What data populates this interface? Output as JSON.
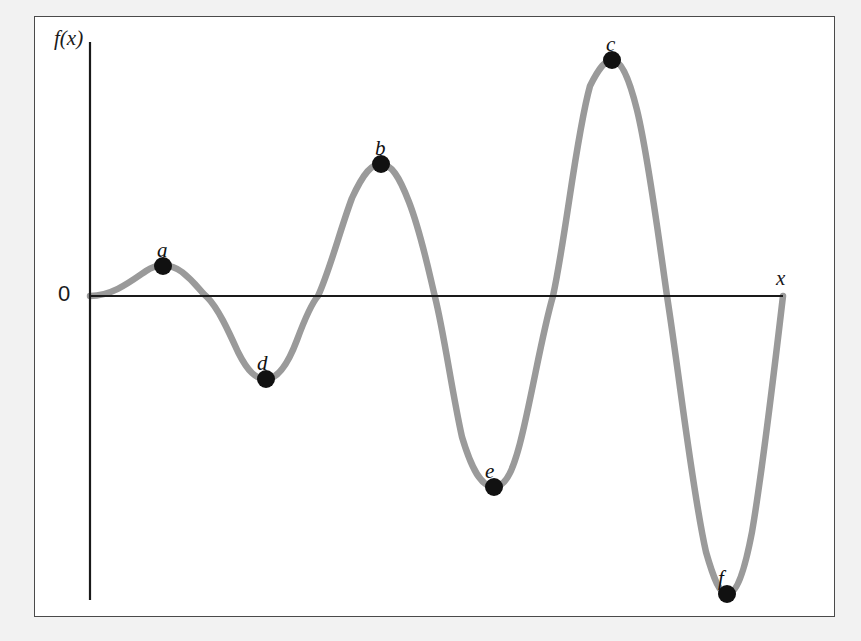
{
  "figure": {
    "background_color": "#f2f2f2",
    "panel_color": "#ffffff",
    "frame_color": "#4a4a4a",
    "curve_color": "#9a9a9a",
    "axis_color": "#1a1a1a",
    "marker_color": "#111111"
  },
  "axes": {
    "y_label": "f(x)",
    "x_label": "x",
    "origin_label": "0"
  },
  "chart_data": {
    "type": "line",
    "title": "",
    "xlabel": "x",
    "ylabel": "f(x)",
    "grid": false,
    "legend": "none",
    "xlim": [
      0,
      800
    ],
    "ylim": [
      -320,
      250
    ],
    "axis_pixels": {
      "x_axis_y": 296,
      "y_axis_x": 90,
      "x_axis_end": 783,
      "y_axis_top": 42,
      "y_axis_bottom": 600
    },
    "zero_crossings_px": [
      90,
      207,
      318,
      435,
      553,
      667,
      783
    ],
    "labeled_points": [
      {
        "label": "a",
        "kind": "local maximum",
        "x_px": 163,
        "y_px": 266,
        "label_x_px": 157,
        "label_y_px": 238
      },
      {
        "label": "b",
        "kind": "local maximum",
        "x_px": 381,
        "y_px": 164,
        "label_x_px": 375,
        "label_y_px": 136
      },
      {
        "label": "c",
        "kind": "global maximum",
        "x_px": 612,
        "y_px": 60,
        "label_x_px": 606,
        "label_y_px": 32
      },
      {
        "label": "d",
        "kind": "local minimum",
        "x_px": 266,
        "y_px": 379,
        "label_x_px": 257,
        "label_y_px": 351
      },
      {
        "label": "e",
        "kind": "local minimum",
        "x_px": 494,
        "y_px": 487,
        "label_x_px": 485,
        "label_y_px": 459
      },
      {
        "label": "f",
        "kind": "global minimum",
        "x_px": 727,
        "y_px": 594,
        "label_x_px": 718,
        "label_y_px": 566
      }
    ],
    "curve_path": "M 90,296 C 112,296 130,282 146,271 C 156,264 170,263 182,272 C 196,283 200,291 207,297 C 218,308 228,330 238,352 C 248,372 256,379 266,379 C 278,379 288,364 297,340 C 307,313 312,303 318,296 C 330,270 340,230 352,198 C 364,172 372,164 381,164 C 391,164 399,176 409,202 C 421,233 428,268 435,297 C 444,333 452,392 462,437 C 474,477 484,487 494,487 C 506,487 514,470 523,431 C 534,384 543,330 553,296 C 566,236 576,136 590,86 C 600,66 606,60 612,60 C 620,60 628,74 637,110 C 648,155 658,233 667,296 C 680,380 692,490 706,552 C 714,580 720,594 727,594 C 736,594 744,574 752,532 C 762,474 772,390 783,296"
  }
}
